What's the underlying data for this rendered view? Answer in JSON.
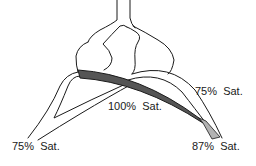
{
  "diagram": {
    "colors": {
      "outline": "#1a1a1a",
      "saturated_band": "#555555",
      "mixed_band": "#b3b3b3",
      "background": "#ffffff"
    },
    "labels": {
      "right_upper": "75%  Sat.",
      "center": "100%  Sat.",
      "left_lower": "75%  Sat.",
      "right_lower": "87%  Sat."
    }
  }
}
